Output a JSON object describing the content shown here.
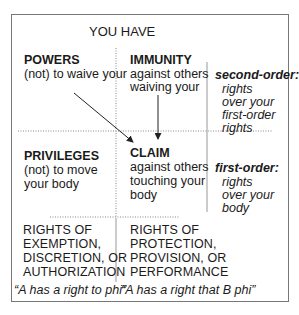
{
  "header": {
    "title": "YOU HAVE"
  },
  "cells": {
    "powers": {
      "title": "POWERS",
      "desc": "(not) to waive your"
    },
    "immunity": {
      "title": "IMMUNITY",
      "desc_lines": [
        "against others",
        "waiving your"
      ]
    },
    "privileges": {
      "title": "PRIVILEGES",
      "desc_lines": [
        "(not) to move",
        "your body"
      ]
    },
    "claim": {
      "title": "CLAIM",
      "desc_lines": [
        "against others",
        "touching your",
        "body"
      ]
    }
  },
  "side_labels": {
    "second_order": {
      "title": "second-order:",
      "lines": [
        "rights",
        "over your",
        "first-order",
        "rights"
      ]
    },
    "first_order": {
      "title": "first-order:",
      "lines": [
        "rights",
        "over your",
        "body"
      ]
    }
  },
  "categories": {
    "left": {
      "lines": [
        "RIGHTS OF",
        "EXEMPTION,",
        "DISCRETION, OR",
        "AUTHORIZATION"
      ],
      "formula": "“A has a right to phi”"
    },
    "right": {
      "lines": [
        "RIGHTS OF",
        "PROTECTION,",
        "PROVISION, OR",
        "PERFORMANCE"
      ],
      "formula": "“A has a right that B phi”"
    }
  },
  "arrows": [
    {
      "name": "powers-to-claim",
      "from": [
        74,
        93
      ],
      "to": [
        133,
        142
      ]
    },
    {
      "name": "immunity-to-claim",
      "from": [
        158,
        95
      ],
      "to": [
        158,
        139
      ]
    }
  ],
  "colors": {
    "text": "#1a1a1a",
    "lines": "#777777",
    "dotted": "#888888"
  }
}
